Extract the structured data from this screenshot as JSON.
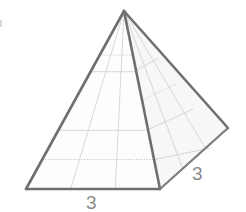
{
  "figure": {
    "name": "square-pyramid-diagram",
    "kind": "3d-geometric-solid",
    "solid": "square pyramid",
    "style": "hand-drawn scanned line drawing, grayscale",
    "labels": [
      {
        "id": "base-front-edge",
        "text": "3",
        "position": "below front base edge"
      },
      {
        "id": "base-right-edge",
        "text": "3",
        "position": "right of lower-right base edge"
      }
    ],
    "geometry": {
      "apex": [
        124,
        11
      ],
      "front_left_base": [
        26,
        189
      ],
      "front_right_base": [
        160,
        189
      ],
      "right_back_base": [
        228,
        128
      ],
      "faces": [
        {
          "id": "front-face",
          "vertices": [
            [
              124,
              11
            ],
            [
              26,
              189
            ],
            [
              160,
              189
            ]
          ],
          "grid": "3x3"
        },
        {
          "id": "right-face",
          "vertices": [
            [
              124,
              11
            ],
            [
              160,
              189
            ],
            [
              228,
              128
            ]
          ],
          "grid": "3x3"
        }
      ]
    },
    "colors": {
      "outline": "#6f6f6f",
      "grid": "#d2d2d2",
      "grid_dotted": "#b9b9b9",
      "label_text": "#8a8a8a",
      "front_face_fill": "#fdfdfd",
      "right_face_fill": "#f7f7f7",
      "background": "#ffffff"
    }
  },
  "label_bottom": "3",
  "label_right": "3"
}
